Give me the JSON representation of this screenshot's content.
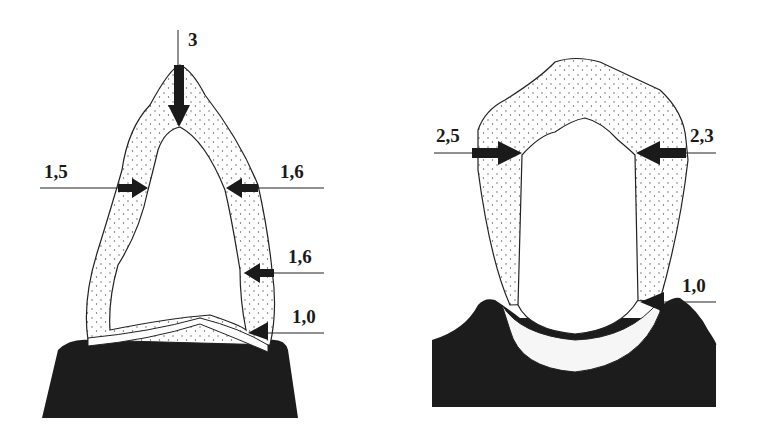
{
  "figure": {
    "colors": {
      "gum": "#1c1c1c",
      "crown_stipple": "#f2f2f2",
      "outline": "#222222",
      "arrow": "#1a1a1a"
    },
    "left_tooth": {
      "name": "anterior-tooth",
      "labels": [
        {
          "id": "incisal",
          "text": "3"
        },
        {
          "id": "left-mid",
          "text": "1,5"
        },
        {
          "id": "right-upper",
          "text": "1,6"
        },
        {
          "id": "right-lower",
          "text": "1,6"
        },
        {
          "id": "cervical",
          "text": "1,0"
        }
      ]
    },
    "right_tooth": {
      "name": "posterior-tooth",
      "labels": [
        {
          "id": "left-upper",
          "text": "2,5"
        },
        {
          "id": "right-upper",
          "text": "2,3"
        },
        {
          "id": "cervical",
          "text": "1,0"
        }
      ]
    }
  }
}
